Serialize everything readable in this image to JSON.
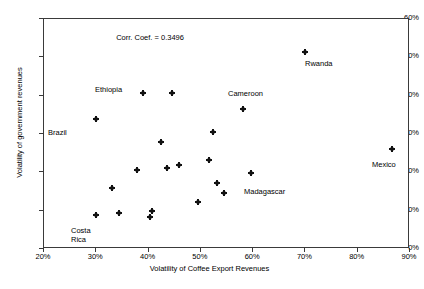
{
  "chart_data": {
    "type": "scatter",
    "title": "",
    "xlabel": "Volatility of Coffee Export Revenues",
    "ylabel": "Volatility of government revenues",
    "xlim": [
      20,
      90
    ],
    "ylim": [
      0,
      60
    ],
    "xticks": [
      "20%",
      "30%",
      "40%",
      "50%",
      "60%",
      "70%",
      "80%",
      "90%"
    ],
    "xtick_values": [
      20,
      30,
      40,
      50,
      60,
      70,
      80,
      90
    ],
    "yticks": [
      "0%",
      "10%",
      "20%",
      "30%",
      "40%",
      "50%",
      "60%"
    ],
    "ytick_values": [
      0,
      10,
      20,
      30,
      40,
      50,
      60
    ],
    "grid": false,
    "legend": null,
    "annotations": [
      {
        "text": "Corr. Coef. = 0.3496",
        "x": 34.0,
        "y": 55.0
      }
    ],
    "correlation_coefficient": 0.3496,
    "point_color": "#111111",
    "frame_color": "#3a3a3a",
    "points": [
      {
        "x": 30.0,
        "y": 34.0,
        "label": "Brazil"
      },
      {
        "x": 30.0,
        "y": 8.8,
        "label": "Costa Rica"
      },
      {
        "x": 33.0,
        "y": 16.0,
        "label": ""
      },
      {
        "x": 34.4,
        "y": 9.3,
        "label": ""
      },
      {
        "x": 37.8,
        "y": 20.5,
        "label": ""
      },
      {
        "x": 39.0,
        "y": 40.7,
        "label": "Ethiopia"
      },
      {
        "x": 40.2,
        "y": 8.3,
        "label": ""
      },
      {
        "x": 40.6,
        "y": 9.9,
        "label": ""
      },
      {
        "x": 42.3,
        "y": 28.0,
        "label": ""
      },
      {
        "x": 43.5,
        "y": 21.1,
        "label": ""
      },
      {
        "x": 44.5,
        "y": 40.7,
        "label": ""
      },
      {
        "x": 45.8,
        "y": 21.9,
        "label": ""
      },
      {
        "x": 49.5,
        "y": 12.3,
        "label": ""
      },
      {
        "x": 51.6,
        "y": 23.3,
        "label": ""
      },
      {
        "x": 52.3,
        "y": 30.4,
        "label": ""
      },
      {
        "x": 53.0,
        "y": 17.2,
        "label": ""
      },
      {
        "x": 54.5,
        "y": 14.5,
        "label": ""
      },
      {
        "x": 58.0,
        "y": 36.5,
        "label": "Cameroon"
      },
      {
        "x": 59.5,
        "y": 19.8,
        "label": "Madagascar"
      },
      {
        "x": 70.0,
        "y": 51.5,
        "label": "Rwanda"
      },
      {
        "x": 86.5,
        "y": 26.2,
        "label": "Mexico"
      }
    ],
    "point_labels": [
      {
        "text": "Brazil",
        "px": 48,
        "py": 128
      },
      {
        "text": "Costa",
        "px": 71,
        "py": 226
      },
      {
        "text": "Rica",
        "px": 71,
        "py": 235
      },
      {
        "text": "Ethiopia",
        "px": 95,
        "py": 85
      },
      {
        "text": "Cameroon",
        "px": 228,
        "py": 89
      },
      {
        "text": "Madagascar",
        "px": 244,
        "py": 187
      },
      {
        "text": "Rwanda",
        "px": 305,
        "py": 59
      },
      {
        "text": "Mexico",
        "px": 372,
        "py": 160
      }
    ]
  }
}
